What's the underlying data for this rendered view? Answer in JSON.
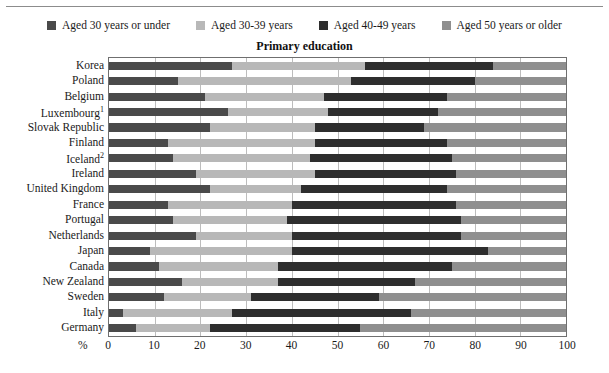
{
  "legend": {
    "items": [
      {
        "label": "Aged 30 years or under",
        "color": "#4a4a4a",
        "swatch_name": "legend-swatch-aged-30-or-under"
      },
      {
        "label": "Aged 30-39 years",
        "color": "#b8b8b8",
        "swatch_name": "legend-swatch-aged-30-39"
      },
      {
        "label": "Aged 40-49 years",
        "color": "#2e2e2e",
        "swatch_name": "legend-swatch-aged-40-49"
      },
      {
        "label": "Aged 50 years or older",
        "color": "#8f8f8f",
        "swatch_name": "legend-swatch-aged-50-or-older"
      }
    ]
  },
  "axis": {
    "percent_symbol": "%",
    "xticks": [
      "0",
      "10",
      "20",
      "30",
      "40",
      "50",
      "60",
      "70",
      "80",
      "90",
      "100"
    ]
  },
  "chart_data": {
    "type": "bar",
    "orientation": "horizontal",
    "stacked": true,
    "normalized_percent": true,
    "title": "Primary education",
    "xlabel": "%",
    "ylabel": "",
    "xlim": [
      0,
      100
    ],
    "grid": true,
    "legend_position": "top",
    "series": [
      {
        "name": "Aged 30 years or under",
        "color": "#4a4a4a",
        "values": [
          27,
          15,
          21,
          26,
          22,
          13,
          14,
          19,
          22,
          13,
          14,
          19,
          9,
          11,
          16,
          12,
          3,
          6
        ]
      },
      {
        "name": "Aged 30-39 years",
        "color": "#b8b8b8",
        "values": [
          29,
          38,
          26,
          22,
          23,
          32,
          30,
          26,
          20,
          27,
          25,
          21,
          31,
          26,
          21,
          19,
          24,
          16
        ]
      },
      {
        "name": "Aged 40-49 years",
        "color": "#2e2e2e",
        "values": [
          28,
          27,
          27,
          24,
          24,
          29,
          31,
          31,
          32,
          36,
          38,
          37,
          43,
          38,
          30,
          28,
          39,
          33
        ]
      },
      {
        "name": "Aged 50 years or older",
        "color": "#8f8f8f",
        "values": [
          16,
          20,
          26,
          28,
          31,
          26,
          25,
          24,
          26,
          24,
          23,
          23,
          17,
          25,
          33,
          41,
          34,
          45
        ]
      }
    ],
    "categories": [
      "Korea",
      "Poland",
      "Belgium",
      "Luxembourg",
      "Slovak Republic",
      "Finland",
      "Iceland",
      "Ireland",
      "United Kingdom",
      "France",
      "Portugal",
      "Netherlands",
      "Japan",
      "Canada",
      "New Zealand",
      "Sweden",
      "Italy",
      "Germany"
    ],
    "category_labels": [
      {
        "name": "Korea",
        "footnote": ""
      },
      {
        "name": "Poland",
        "footnote": ""
      },
      {
        "name": "Belgium",
        "footnote": ""
      },
      {
        "name": "Luxembourg",
        "footnote": "1"
      },
      {
        "name": "Slovak Republic",
        "footnote": ""
      },
      {
        "name": "Finland",
        "footnote": ""
      },
      {
        "name": "Iceland",
        "footnote": "2"
      },
      {
        "name": "Ireland",
        "footnote": ""
      },
      {
        "name": "United Kingdom",
        "footnote": ""
      },
      {
        "name": "France",
        "footnote": ""
      },
      {
        "name": "Portugal",
        "footnote": ""
      },
      {
        "name": "Netherlands",
        "footnote": ""
      },
      {
        "name": "Japan",
        "footnote": ""
      },
      {
        "name": "Canada",
        "footnote": ""
      },
      {
        "name": "New Zealand",
        "footnote": ""
      },
      {
        "name": "Sweden",
        "footnote": ""
      },
      {
        "name": "Italy",
        "footnote": ""
      },
      {
        "name": "Germany",
        "footnote": ""
      }
    ]
  }
}
